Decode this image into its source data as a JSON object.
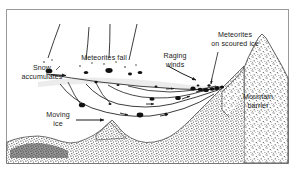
{
  "figure": {
    "type": "scientific-diagram",
    "border_color": "#9a9a9a",
    "background_color": "#ffffff",
    "ink_color": "#1a1a1a",
    "ice_fill_color": "#eceaea",
    "stipple_color": "#2a2a2a"
  },
  "labels": {
    "snow_accumulates_line1": "Snow",
    "snow_accumulates_line2": "accumulates",
    "meteorites_fall": "Meteorites fall",
    "raging_winds_line1": "Raging",
    "raging_winds_line2": "winds",
    "meteorites_scoured_line1": "Meteorites",
    "meteorites_scoured_line2": "on scoured ice",
    "mountain_barrier_line1": "Mountain",
    "mountain_barrier_line2": "barrier",
    "moving_ice_line1": "Moving",
    "moving_ice_line2": "ice"
  }
}
